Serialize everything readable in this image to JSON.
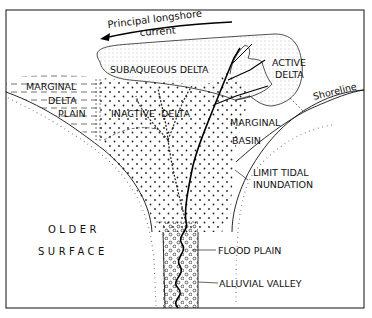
{
  "diagram": {
    "type": "delta-environments-map",
    "labels": {
      "current_line1": "Principal longshore",
      "current_line2": "current",
      "subaqueous_delta": "SUBAQUEOUS DELTA",
      "active_delta_1": "ACTIVE",
      "active_delta_2": "DELTA",
      "marginal_delta_plain_1": "MARGINAL",
      "marginal_delta_plain_2": "DELTA",
      "marginal_delta_plain_3": "PLAIN",
      "inactive_delta": "INACTIVE  DELTA",
      "shoreline": "Shoreline",
      "marginal_basin_1": "MARGINAL",
      "marginal_basin_2": "BASIN",
      "limit_tidal_1": "LIMIT TIDAL",
      "limit_tidal_2": "INUNDATION",
      "older_surface_1": "OLDER",
      "older_surface_2": "SURFACE",
      "flood_plain": "FLOOD PLAIN",
      "alluvial_valley": "ALLUVIAL VALLEY"
    },
    "colors": {
      "line": "#111111",
      "background": "#ffffff",
      "stipple": "#333333"
    }
  }
}
